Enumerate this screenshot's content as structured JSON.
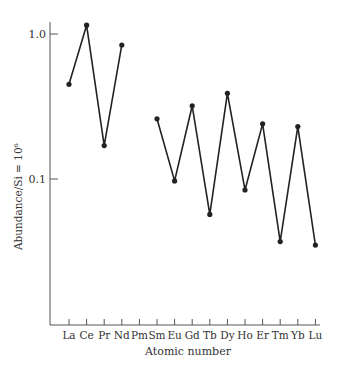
{
  "chart_data": {
    "type": "line",
    "title": "",
    "xlabel": "Atomic number",
    "ylabel": "Abundance/Si = 10⁶",
    "yscale": "log",
    "yticks": [
      {
        "value": 1.0,
        "label": "1.0"
      },
      {
        "value": 0.1,
        "label": "0.1"
      }
    ],
    "ylim": [
      0.013,
      1.3
    ],
    "grid": false,
    "categories": [
      "La",
      "Ce",
      "Pr",
      "Nd",
      "Pm",
      "Sm",
      "Eu",
      "Gd",
      "Tb",
      "Dy",
      "Ho",
      "Er",
      "Tm",
      "Yb",
      "Lu"
    ],
    "series": [
      {
        "name": "Abundance",
        "values": [
          0.45,
          1.15,
          0.17,
          0.84,
          null,
          0.26,
          0.097,
          0.32,
          0.057,
          0.39,
          0.084,
          0.24,
          0.037,
          0.23,
          0.035
        ]
      }
    ]
  }
}
